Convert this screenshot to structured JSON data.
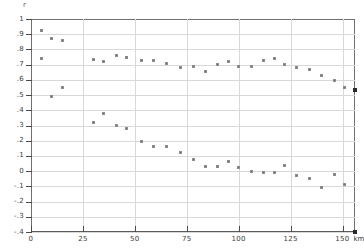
{
  "chart_data": {
    "type": "scatter",
    "title": "",
    "xlabel": "km",
    "ylabel": "r",
    "xlim": [
      0,
      156
    ],
    "ylim": [
      -0.4,
      1.0
    ],
    "grid": true,
    "legend": "none",
    "x_ticks": [
      "0",
      "25",
      "50",
      "75",
      "100",
      "125",
      "150"
    ],
    "x_tick_values": [
      0,
      25,
      50,
      75,
      100,
      125,
      150
    ],
    "x_unit": "km",
    "y_ticks": [
      "1",
      ".9",
      ".8",
      ".7",
      ".6",
      ".5",
      ".4",
      ".3",
      ".2",
      ".1",
      "0",
      "-.1",
      "-.2",
      "-.3",
      "-.4"
    ],
    "y_tick_values": [
      1,
      0.9,
      0.8,
      0.7,
      0.6,
      0.5,
      0.4,
      0.3,
      0.2,
      0.1,
      0,
      -0.1,
      -0.2,
      -0.3,
      -0.4
    ],
    "series": [
      {
        "name": "upper",
        "points": [
          [
            5,
            0.925
          ],
          [
            10,
            0.872
          ],
          [
            15,
            0.861
          ],
          [
            5,
            0.742
          ],
          [
            30,
            0.731
          ],
          [
            35,
            0.721
          ],
          [
            41,
            0.762
          ],
          [
            46,
            0.749
          ],
          [
            53,
            0.728
          ],
          [
            59,
            0.729
          ],
          [
            65,
            0.707
          ],
          [
            72,
            0.68
          ],
          [
            78,
            0.689
          ],
          [
            84,
            0.658
          ],
          [
            90,
            0.699
          ],
          [
            95,
            0.721
          ],
          [
            100,
            0.69
          ],
          [
            106,
            0.69
          ],
          [
            112,
            0.73
          ],
          [
            117,
            0.742
          ],
          [
            122,
            0.699
          ],
          [
            128,
            0.68
          ],
          [
            134,
            0.668
          ],
          [
            140,
            0.63
          ],
          [
            146,
            0.598
          ],
          [
            151,
            0.553
          ]
        ]
      },
      {
        "name": "lower",
        "points": [
          [
            10,
            0.489
          ],
          [
            15,
            0.551
          ],
          [
            30,
            0.321
          ],
          [
            35,
            0.381
          ],
          [
            41,
            0.3
          ],
          [
            46,
            0.281
          ],
          [
            53,
            0.195
          ],
          [
            59,
            0.161
          ],
          [
            65,
            0.161
          ],
          [
            72,
            0.121
          ],
          [
            78,
            0.079
          ],
          [
            84,
            0.03
          ],
          [
            90,
            0.031
          ],
          [
            95,
            0.061
          ],
          [
            100,
            0.021
          ],
          [
            106,
            0.001
          ],
          [
            112,
            -0.009
          ],
          [
            117,
            -0.009
          ],
          [
            122,
            0.04
          ],
          [
            128,
            -0.03
          ],
          [
            134,
            -0.049
          ],
          [
            140,
            -0.11
          ],
          [
            146,
            -0.02
          ],
          [
            151,
            -0.09
          ]
        ]
      }
    ],
    "edge_markers": [
      [
        156,
        0.531
      ],
      [
        156,
        -0.4
      ]
    ]
  }
}
